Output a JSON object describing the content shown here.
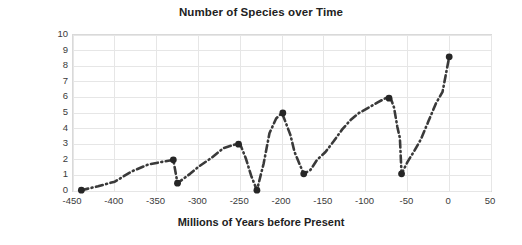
{
  "chart_data": {
    "type": "line",
    "title": "Number of Species over Time",
    "xlabel": "Millions of Years before Present",
    "ylabel": "Millions of Species",
    "xlim": [
      -450,
      50
    ],
    "ylim": [
      0,
      10
    ],
    "xticks": [
      -450,
      -400,
      -350,
      -300,
      -250,
      -200,
      -150,
      -100,
      -50,
      0,
      50
    ],
    "yticks": [
      0,
      1,
      2,
      3,
      4,
      5,
      6,
      7,
      8,
      9,
      10
    ],
    "xtick_labels": [
      "-450",
      "-400",
      "-350",
      "-300",
      "-250",
      "-200",
      "-150",
      "-100",
      "-50",
      "0",
      "50"
    ],
    "ytick_labels": [
      "0",
      "1",
      "2",
      "3",
      "4",
      "5",
      "6",
      "7",
      "8",
      "9",
      "10"
    ],
    "grid": true,
    "legend": "none",
    "line_style": "dash-dot",
    "line_color": "#3a3a3a",
    "marker_color": "#262626",
    "grid_color": "#e6e6e6",
    "series": [
      {
        "name": "Millions of Species",
        "x": [
          -440,
          -420,
          -400,
          -380,
          -360,
          -345,
          -330,
          -325,
          -310,
          -300,
          -285,
          -270,
          -255,
          -250,
          -243,
          -237,
          -230,
          -222,
          -215,
          -207,
          -200,
          -196,
          -190,
          -185,
          -178,
          -174,
          -166,
          -158,
          -148,
          -138,
          -128,
          -118,
          -108,
          -96,
          -85,
          -76,
          -70,
          -66,
          -62,
          -59,
          -57,
          -50,
          -42,
          -34,
          -25,
          -16,
          -8,
          0
        ],
        "y": [
          0.05,
          0.3,
          0.6,
          1.25,
          1.7,
          1.85,
          2.0,
          0.5,
          1.1,
          1.55,
          2.1,
          2.75,
          3.0,
          3.0,
          2.05,
          1.0,
          0.05,
          1.75,
          3.7,
          4.65,
          5.0,
          4.45,
          3.6,
          2.5,
          1.6,
          1.1,
          1.35,
          2.0,
          2.5,
          3.2,
          3.95,
          4.55,
          5.0,
          5.35,
          5.7,
          5.95,
          5.95,
          5.35,
          4.1,
          3.4,
          1.1,
          1.85,
          2.55,
          3.3,
          4.45,
          5.6,
          6.35,
          8.6
        ]
      }
    ],
    "markers": [
      {
        "x": -440,
        "y": 0.05
      },
      {
        "x": -330,
        "y": 2.0
      },
      {
        "x": -325,
        "y": 0.5
      },
      {
        "x": -252,
        "y": 3.0
      },
      {
        "x": -230,
        "y": 0.05
      },
      {
        "x": -199,
        "y": 5.0
      },
      {
        "x": -174,
        "y": 1.1
      },
      {
        "x": -72,
        "y": 5.95
      },
      {
        "x": -57,
        "y": 1.1
      },
      {
        "x": 0,
        "y": 8.6
      }
    ]
  }
}
